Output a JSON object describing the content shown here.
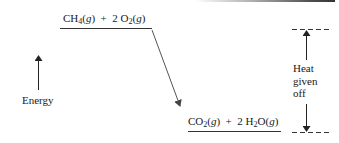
{
  "diagram": {
    "reactants": {
      "species": [
        {
          "coef": "",
          "formula_main": "CH",
          "sub": "4",
          "state": "g"
        },
        {
          "coef": "2 ",
          "formula_main": "O",
          "sub": "2",
          "state": "g"
        }
      ],
      "label_text": "CH4(g) + 2 O2(g)"
    },
    "products": {
      "species": [
        {
          "coef": "",
          "formula_main": "CO",
          "sub": "2",
          "state": "g"
        },
        {
          "coef": "2 ",
          "formula_main": "H",
          "sub": "2",
          "tail": "O",
          "state": "g"
        }
      ],
      "label_text": "CO2(g) + 2 H2O(g)"
    },
    "axis_label": "Energy",
    "heat_label": [
      "Heat",
      "given",
      "off"
    ],
    "colors": {
      "ink": "#1a1a1a",
      "arrow": "#555555",
      "background": "#ffffff"
    }
  }
}
